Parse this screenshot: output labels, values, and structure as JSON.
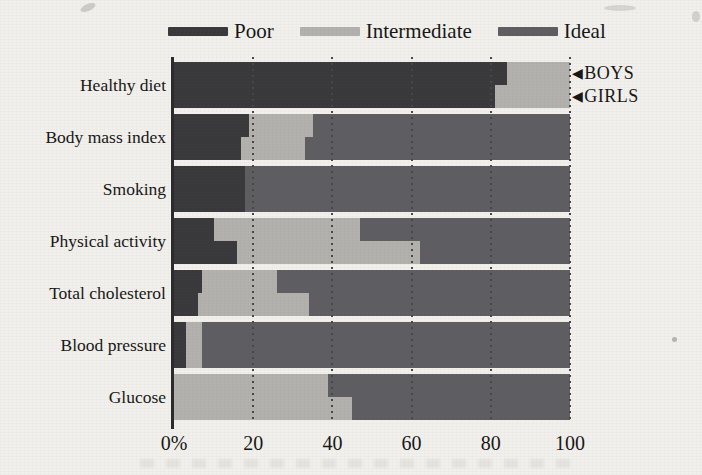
{
  "figure": {
    "background": "#f2f0ec"
  },
  "chart_data": {
    "type": "bar",
    "orientation": "horizontal",
    "stacked": true,
    "title": "",
    "unit": "%",
    "categories": [
      "Healthy diet",
      "Body mass index",
      "Smoking",
      "Physical activity",
      "Total cholesterol",
      "Blood pressure",
      "Glucose"
    ],
    "segments": [
      "Poor",
      "Intermediate",
      "Ideal"
    ],
    "colors": {
      "poor": "#39383b",
      "intermediate": "#b3b1ad",
      "ideal": "#5e5d61"
    },
    "legend": [
      {
        "label": "Poor",
        "key": "poor"
      },
      {
        "label": "Intermediate",
        "key": "intermediate"
      },
      {
        "label": "Ideal",
        "key": "ideal"
      }
    ],
    "x_axis": {
      "range": [
        0,
        100
      ],
      "tick_values": [
        0,
        20,
        40,
        60,
        80,
        100
      ],
      "tick_labels": [
        "0%",
        "20",
        "40",
        "60",
        "80",
        "100"
      ],
      "gridline_style": "dotted"
    },
    "row_markers": [
      {
        "symbol": "◀",
        "label": "BOYS"
      },
      {
        "symbol": "◀",
        "label": "GIRLS"
      }
    ],
    "groups": [
      {
        "category": "Healthy diet",
        "boys": {
          "poor": 84,
          "intermediate": 16,
          "ideal": 0
        },
        "girls": {
          "poor": 81,
          "intermediate": 19,
          "ideal": 0
        }
      },
      {
        "category": "Body mass index",
        "boys": {
          "poor": 19,
          "intermediate": 16,
          "ideal": 65
        },
        "girls": {
          "poor": 17,
          "intermediate": 16,
          "ideal": 67
        }
      },
      {
        "category": "Smoking",
        "boys": {
          "poor": 18,
          "intermediate": 0,
          "ideal": 82
        },
        "girls": {
          "poor": 18,
          "intermediate": 0,
          "ideal": 82
        }
      },
      {
        "category": "Physical activity",
        "boys": {
          "poor": 10,
          "intermediate": 37,
          "ideal": 53
        },
        "girls": {
          "poor": 16,
          "intermediate": 46,
          "ideal": 38
        }
      },
      {
        "category": "Total cholesterol",
        "boys": {
          "poor": 7,
          "intermediate": 19,
          "ideal": 74
        },
        "girls": {
          "poor": 6,
          "intermediate": 28,
          "ideal": 66
        }
      },
      {
        "category": "Blood pressure",
        "boys": {
          "poor": 3,
          "intermediate": 4,
          "ideal": 93
        },
        "girls": {
          "poor": 3,
          "intermediate": 4,
          "ideal": 93
        }
      },
      {
        "category": "Glucose",
        "boys": {
          "poor": 0,
          "intermediate": 39,
          "ideal": 61
        },
        "girls": {
          "poor": 0,
          "intermediate": 45,
          "ideal": 55
        }
      }
    ]
  }
}
